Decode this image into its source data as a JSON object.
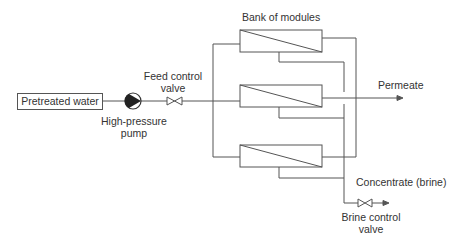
{
  "diagram": {
    "labels": {
      "source": "Pretreated water",
      "pump": "High-pressure pump",
      "pump_line1": "High-pressure",
      "pump_line2": "pump",
      "feed_valve_line1": "Feed control",
      "feed_valve_line2": "valve",
      "bank": "Bank of modules",
      "permeate": "Permeate",
      "concentrate": "Concentrate (brine)",
      "brine_valve_line1": "Brine control",
      "brine_valve_line2": "valve"
    },
    "nodes": [
      {
        "id": "source",
        "label": "Pretreated water",
        "type": "box"
      },
      {
        "id": "pump",
        "label": "High-pressure pump",
        "type": "pump"
      },
      {
        "id": "feed_valve",
        "label": "Feed control valve",
        "type": "valve"
      },
      {
        "id": "module_1",
        "label": "",
        "type": "membrane-module"
      },
      {
        "id": "module_2",
        "label": "",
        "type": "membrane-module"
      },
      {
        "id": "module_3",
        "label": "",
        "type": "membrane-module"
      },
      {
        "id": "permeate",
        "label": "Permeate",
        "type": "outlet"
      },
      {
        "id": "brine_valve",
        "label": "Brine control valve",
        "type": "valve"
      },
      {
        "id": "concentrate",
        "label": "Concentrate (brine)",
        "type": "outlet"
      }
    ],
    "edges": [
      {
        "from": "source",
        "to": "pump"
      },
      {
        "from": "pump",
        "to": "feed_valve"
      },
      {
        "from": "feed_valve",
        "to": "module_1"
      },
      {
        "from": "feed_valve",
        "to": "module_2"
      },
      {
        "from": "feed_valve",
        "to": "module_3"
      },
      {
        "from": "module_1",
        "to": "permeate"
      },
      {
        "from": "module_2",
        "to": "permeate"
      },
      {
        "from": "module_3",
        "to": "permeate"
      },
      {
        "from": "module_1",
        "to": "brine_valve"
      },
      {
        "from": "module_2",
        "to": "brine_valve"
      },
      {
        "from": "module_3",
        "to": "brine_valve"
      },
      {
        "from": "brine_valve",
        "to": "concentrate"
      }
    ],
    "colors": {
      "line": "#555555",
      "text": "#333333",
      "background": "#ffffff"
    }
  }
}
